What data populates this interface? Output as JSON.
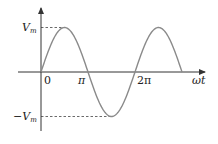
{
  "diagram": {
    "type": "sine-waveform",
    "labels": {
      "vmax": "V",
      "vmax_sub": "m",
      "vmin_prefix": "−V",
      "vmin_sub": "m",
      "origin": "0",
      "pi": "π",
      "two_pi": "2π",
      "x_axis": "ωt"
    },
    "colors": {
      "curve": "#8a8a8a",
      "axes": "#333333",
      "dashed": "#444444",
      "text": "#222222"
    },
    "geometry": {
      "origin_x": 41,
      "axis_y": 72,
      "amplitude_px": 44.5,
      "period_px": 94,
      "curve_end_phase": 3.0
    }
  }
}
